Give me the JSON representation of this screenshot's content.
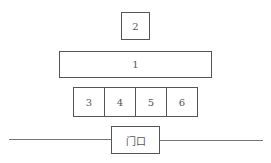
{
  "diagram": {
    "type": "layout-plan",
    "boxes": [
      {
        "id": "2",
        "label": "2"
      },
      {
        "id": "1",
        "label": "1"
      },
      {
        "id": "3",
        "label": "3"
      },
      {
        "id": "4",
        "label": "4"
      },
      {
        "id": "5",
        "label": "5"
      },
      {
        "id": "6",
        "label": "6"
      }
    ],
    "door": {
      "label": "门口"
    }
  }
}
